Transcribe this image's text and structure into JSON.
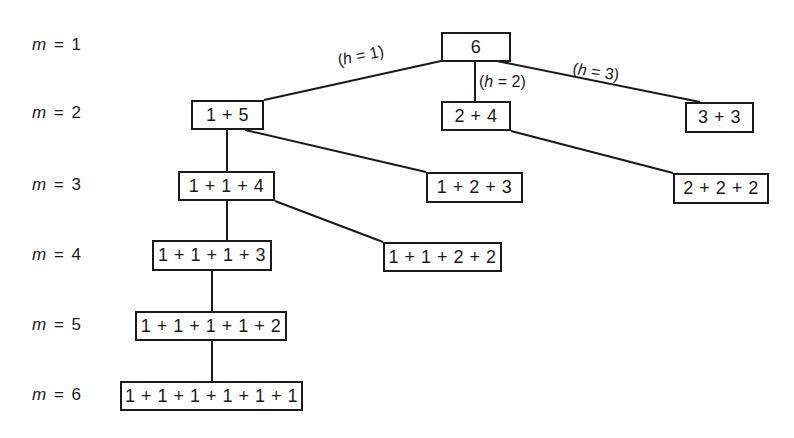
{
  "diagram": {
    "type": "tree",
    "levels": [
      {
        "label_var": "m",
        "label_eq": "=",
        "label_value": "1",
        "y": 46
      },
      {
        "label_var": "m",
        "label_eq": "=",
        "label_value": "2",
        "y": 114
      },
      {
        "label_var": "m",
        "label_eq": "=",
        "label_value": "3",
        "y": 186
      },
      {
        "label_var": "m",
        "label_eq": "=",
        "label_value": "4",
        "y": 256
      },
      {
        "label_var": "m",
        "label_eq": "=",
        "label_value": "5",
        "y": 326
      },
      {
        "label_var": "m",
        "label_eq": "=",
        "label_value": "6",
        "y": 396
      }
    ],
    "nodes": [
      {
        "id": "n6",
        "text": "6",
        "x": 441,
        "y": 32,
        "w": 70,
        "h": 30
      },
      {
        "id": "n15",
        "text": "1 + 5",
        "x": 191,
        "y": 100,
        "w": 73,
        "h": 30
      },
      {
        "id": "n24",
        "text": "2 + 4",
        "x": 441,
        "y": 101,
        "w": 70,
        "h": 30
      },
      {
        "id": "n33",
        "text": "3 + 3",
        "x": 685,
        "y": 102,
        "w": 69,
        "h": 31
      },
      {
        "id": "n114",
        "text": "1 + 1 + 4",
        "x": 178,
        "y": 171,
        "w": 97,
        "h": 30
      },
      {
        "id": "n123",
        "text": "1 + 2 + 3",
        "x": 426,
        "y": 172,
        "w": 97,
        "h": 31
      },
      {
        "id": "n222",
        "text": "2 + 2 + 2",
        "x": 673,
        "y": 173,
        "w": 96,
        "h": 31
      },
      {
        "id": "n1113",
        "text": "1 + 1 + 1 + 3",
        "x": 152,
        "y": 240,
        "w": 120,
        "h": 31
      },
      {
        "id": "n1122",
        "text": "1 + 1 + 2 + 2",
        "x": 383,
        "y": 242,
        "w": 119,
        "h": 30
      },
      {
        "id": "n11112",
        "text": "1 + 1 + 1 + 1 + 2",
        "x": 135,
        "y": 311,
        "w": 152,
        "h": 30
      },
      {
        "id": "n111111",
        "text": "1 + 1 + 1 + 1 + 1 + 1",
        "x": 120,
        "y": 381,
        "w": 183,
        "h": 30
      }
    ],
    "edges": [
      {
        "from": "n6",
        "to": "n15",
        "x1": 441,
        "y1": 61,
        "x2": 264,
        "y2": 100
      },
      {
        "from": "n6",
        "to": "n24",
        "x1": 475,
        "y1": 61,
        "x2": 475,
        "y2": 101
      },
      {
        "from": "n6",
        "to": "n33",
        "x1": 497,
        "y1": 61,
        "x2": 700,
        "y2": 102
      },
      {
        "from": "n15",
        "to": "n114",
        "x1": 227,
        "y1": 130,
        "x2": 227,
        "y2": 171
      },
      {
        "from": "n15",
        "to": "n123",
        "x1": 245,
        "y1": 130,
        "x2": 426,
        "y2": 172
      },
      {
        "from": "n24",
        "to": "n222",
        "x1": 511,
        "y1": 131,
        "x2": 673,
        "y2": 173
      },
      {
        "from": "n114",
        "to": "n1113",
        "x1": 227,
        "y1": 201,
        "x2": 227,
        "y2": 240
      },
      {
        "from": "n114",
        "to": "n1122",
        "x1": 275,
        "y1": 201,
        "x2": 383,
        "y2": 242
      },
      {
        "from": "n1113",
        "to": "n11112",
        "x1": 212,
        "y1": 271,
        "x2": 212,
        "y2": 311
      },
      {
        "from": "n11112",
        "to": "n111111",
        "x1": 212,
        "y1": 341,
        "x2": 212,
        "y2": 381
      }
    ],
    "edge_labels": [
      {
        "text_var": "h",
        "text_value": "1",
        "x": 336,
        "y": 52,
        "rotate": -12
      },
      {
        "text_var": "h",
        "text_value": "2",
        "x": 479,
        "y": 73,
        "rotate": 0
      },
      {
        "text_var": "h",
        "text_value": "3",
        "x": 574,
        "y": 60,
        "rotate": 8
      }
    ],
    "colors": {
      "stroke": "#1a1a1a",
      "background": "#ffffff"
    }
  }
}
